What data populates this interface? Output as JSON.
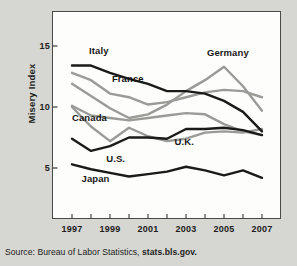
{
  "figure": {
    "background_color": "#d6d6d2",
    "panel_color": "#fdfdfc",
    "border_color": "#4a4a48"
  },
  "source": {
    "prefix": "Source: Bureau of Labor Statistics,",
    "site": "stats.bls.gov."
  },
  "chart_data": {
    "type": "line",
    "title": "",
    "xlabel": "",
    "ylabel": "Misery Index",
    "x": [
      1997,
      1998,
      1999,
      2000,
      2001,
      2002,
      2003,
      2004,
      2005,
      2006,
      2007
    ],
    "xtick_labels": [
      "1997",
      "1999",
      "2001",
      "2003",
      "2005",
      "2007"
    ],
    "xtick_values": [
      1997,
      1999,
      2001,
      2003,
      2005,
      2007
    ],
    "ytick_labels": [
      "15",
      "10",
      "5"
    ],
    "ytick_values": [
      15,
      10,
      5
    ],
    "xlim": [
      1997,
      2007
    ],
    "ylim": [
      2.2,
      16.5
    ],
    "grid": false,
    "legend": "inline-labels",
    "series": [
      {
        "name": "Italy",
        "color": "#1a1a18",
        "width": 2.4,
        "label_x": 1997.9,
        "label_y": 14.6,
        "values": [
          13.4,
          13.4,
          12.8,
          12.3,
          11.9,
          11.3,
          11.3,
          11.1,
          10.5,
          9.6,
          8.0
        ]
      },
      {
        "name": "France",
        "color": "#9a9a96",
        "width": 2.4,
        "label_x": 1999.1,
        "label_y": 12.3,
        "values": [
          12.8,
          12.2,
          11.1,
          10.8,
          10.2,
          10.4,
          10.8,
          11.2,
          11.4,
          11.3,
          10.8
        ]
      },
      {
        "name": "Germany",
        "color": "#9a9a96",
        "width": 2.4,
        "label_x": 2004.1,
        "label_y": 14.4,
        "values": [
          11.9,
          10.9,
          9.9,
          9.1,
          9.4,
          10.2,
          11.3,
          12.2,
          13.3,
          11.7,
          9.7
        ]
      },
      {
        "name": "Canada",
        "color": "#9a9a96",
        "width": 2.4,
        "label_x": 1997.0,
        "label_y": 9.1,
        "values": [
          10.1,
          9.3,
          9.1,
          8.9,
          9.1,
          9.3,
          9.5,
          9.4,
          8.6,
          8.0,
          7.7
        ]
      },
      {
        "name": "U.K.",
        "color": "#9a9a96",
        "width": 2.4,
        "label_x": 2002.4,
        "label_y": 7.1,
        "values": [
          10.0,
          8.4,
          7.2,
          8.3,
          7.6,
          7.2,
          7.4,
          7.9,
          8.0,
          7.9,
          8.2
        ]
      },
      {
        "name": "U.S.",
        "color": "#1a1a18",
        "width": 2.4,
        "label_x": 1998.8,
        "label_y": 5.7,
        "values": [
          7.4,
          6.4,
          6.8,
          7.5,
          7.5,
          7.4,
          8.2,
          8.2,
          8.3,
          8.1,
          7.7
        ]
      },
      {
        "name": "Japan",
        "color": "#1a1a18",
        "width": 2.4,
        "label_x": 1997.5,
        "label_y": 4.1,
        "values": [
          5.3,
          4.9,
          4.6,
          4.3,
          4.5,
          4.7,
          5.1,
          4.8,
          4.4,
          4.8,
          4.2
        ]
      }
    ]
  }
}
